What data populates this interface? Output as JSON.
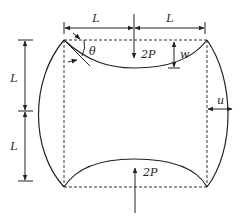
{
  "diagram": {
    "labels": {
      "top_left_span": "L",
      "top_right_span": "L",
      "left_upper_span": "L",
      "left_lower_span": "L",
      "angle": "θ",
      "top_deflection": "w",
      "side_displacement": "u",
      "top_force": "2P",
      "bottom_force": "2P"
    },
    "colors": {
      "stroke": "#222222",
      "background": "#ffffff"
    }
  }
}
